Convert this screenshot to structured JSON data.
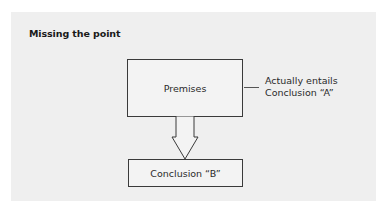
{
  "diagram": {
    "title": "Missing the point",
    "nodes": {
      "premises": {
        "label": "Premises"
      },
      "conclusion_b": {
        "label": "Conclusion “B”"
      }
    },
    "annotation": {
      "line1": "Actually entails",
      "line2": "Conclusion “A”"
    },
    "edges": [
      {
        "from": "premises",
        "to": "conclusion_b",
        "style": "hollow-block-arrow"
      }
    ],
    "colors": {
      "panel_background": "#efefef",
      "page_background": "#ffffff",
      "stroke": "#3a3a3a",
      "text": "#2a2a2a"
    }
  }
}
